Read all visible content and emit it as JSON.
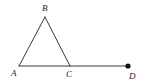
{
  "figure": {
    "kind": "geometry-diagram",
    "canvas": {
      "width": 143,
      "height": 84,
      "background": "#ffffff"
    },
    "style": {
      "stroke_color": "#3a3a3a",
      "stroke_width": 1,
      "label_color": "#1a1a1a",
      "label_font_size": 9,
      "point_fill": "#111111",
      "point_radius": 2.6
    },
    "points": [
      {
        "id": "A",
        "label": "A",
        "x": 19,
        "y": 66,
        "marked": false,
        "label_x": 11,
        "label_y": 76
      },
      {
        "id": "B",
        "label": "B",
        "x": 45,
        "y": 17,
        "marked": false,
        "label_x": 42,
        "label_y": 11
      },
      {
        "id": "C",
        "label": "C",
        "x": 70,
        "y": 66,
        "marked": false,
        "label_x": 66,
        "label_y": 77
      },
      {
        "id": "D",
        "label": "D",
        "x": 128,
        "y": 66,
        "marked": true,
        "label_x": 129,
        "label_y": 79
      }
    ],
    "segments": [
      {
        "id": "AB",
        "from": "A",
        "to": "B",
        "x1": 19,
        "y1": 66,
        "x2": 45,
        "y2": 17
      },
      {
        "id": "BC",
        "from": "B",
        "to": "C",
        "x1": 45,
        "y1": 17,
        "x2": 70,
        "y2": 66
      },
      {
        "id": "AD",
        "from": "A",
        "to": "D",
        "x1": 19,
        "y1": 66,
        "x2": 128,
        "y2": 66
      }
    ]
  }
}
